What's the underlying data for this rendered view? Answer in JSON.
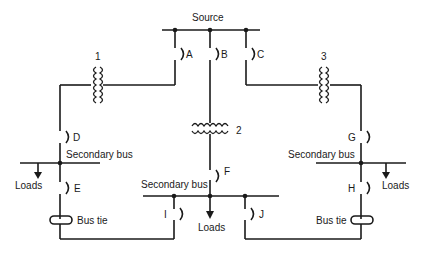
{
  "diagram": {
    "type": "radial-secondary-selective power distribution one-line diagram",
    "source_label": "Source",
    "transformers": [
      {
        "id": "t1",
        "label": "1"
      },
      {
        "id": "t2",
        "label": "2"
      },
      {
        "id": "t3",
        "label": "3"
      }
    ],
    "breakers": [
      {
        "id": "A",
        "label": "A"
      },
      {
        "id": "B",
        "label": "B"
      },
      {
        "id": "C",
        "label": "C"
      },
      {
        "id": "D",
        "label": "D"
      },
      {
        "id": "E",
        "label": "E"
      },
      {
        "id": "F",
        "label": "F"
      },
      {
        "id": "G",
        "label": "G"
      },
      {
        "id": "H",
        "label": "H"
      },
      {
        "id": "I",
        "label": "I"
      },
      {
        "id": "J",
        "label": "J"
      }
    ],
    "secondary_buses": [
      {
        "id": "left",
        "label": "Secondary bus",
        "loads_label": "Loads"
      },
      {
        "id": "center",
        "label": "Secondary bus",
        "loads_label": "Loads"
      },
      {
        "id": "right",
        "label": "Secondary bus",
        "loads_label": "Loads"
      }
    ],
    "bus_ties": [
      {
        "id": "left",
        "label": "Bus tie"
      },
      {
        "id": "right",
        "label": "Bus tie"
      }
    ],
    "colors": {
      "line": "#1a1a1a",
      "background": "#ffffff"
    }
  }
}
